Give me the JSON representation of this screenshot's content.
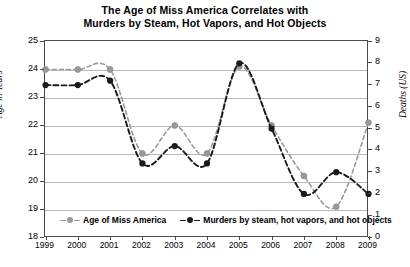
{
  "chart_data": {
    "type": "line",
    "title": "The Age of Miss America Correlates with Murders by Steam, Hot Vapors, and Hot Objects",
    "title_line1": "The Age of Miss America Correlates with",
    "title_line2": "Murders by Steam, Hot Vapors, and Hot Objects",
    "categories": [
      "1999",
      "2000",
      "2001",
      "2002",
      "2003",
      "2004",
      "2005",
      "2006",
      "2007",
      "2008",
      "2009"
    ],
    "x": [
      1999,
      2000,
      2001,
      2002,
      2003,
      2004,
      2005,
      2006,
      2007,
      2008,
      2009
    ],
    "xlabel": "",
    "grid": true,
    "legend_position": "bottom-inside",
    "series": [
      {
        "name": "Age of Miss America",
        "axis": "left",
        "color": "#9a9a9a",
        "marker": "circle",
        "linestyle": "dashed",
        "values": [
          24.0,
          24.0,
          24.0,
          21.0,
          22.0,
          21.0,
          24.1,
          22.0,
          20.2,
          19.1,
          22.1
        ]
      },
      {
        "name": "Murders by steam, hot vapors, and hot objects",
        "axis": "right",
        "color": "#1a1a1a",
        "marker": "circle",
        "linestyle": "dashed",
        "values": [
          7.0,
          7.0,
          7.2,
          3.4,
          4.2,
          3.4,
          8.0,
          5.0,
          2.0,
          3.0,
          2.0
        ]
      }
    ],
    "left_axis": {
      "label": "Age in Years",
      "min": 18,
      "max": 25,
      "ticks": [
        18,
        19,
        20,
        21,
        22,
        23,
        24,
        25
      ]
    },
    "right_axis": {
      "label": "Deaths (US)",
      "min": 0,
      "max": 9,
      "ticks": [
        0,
        1,
        2,
        3,
        4,
        5,
        6,
        7,
        8,
        9
      ]
    }
  }
}
